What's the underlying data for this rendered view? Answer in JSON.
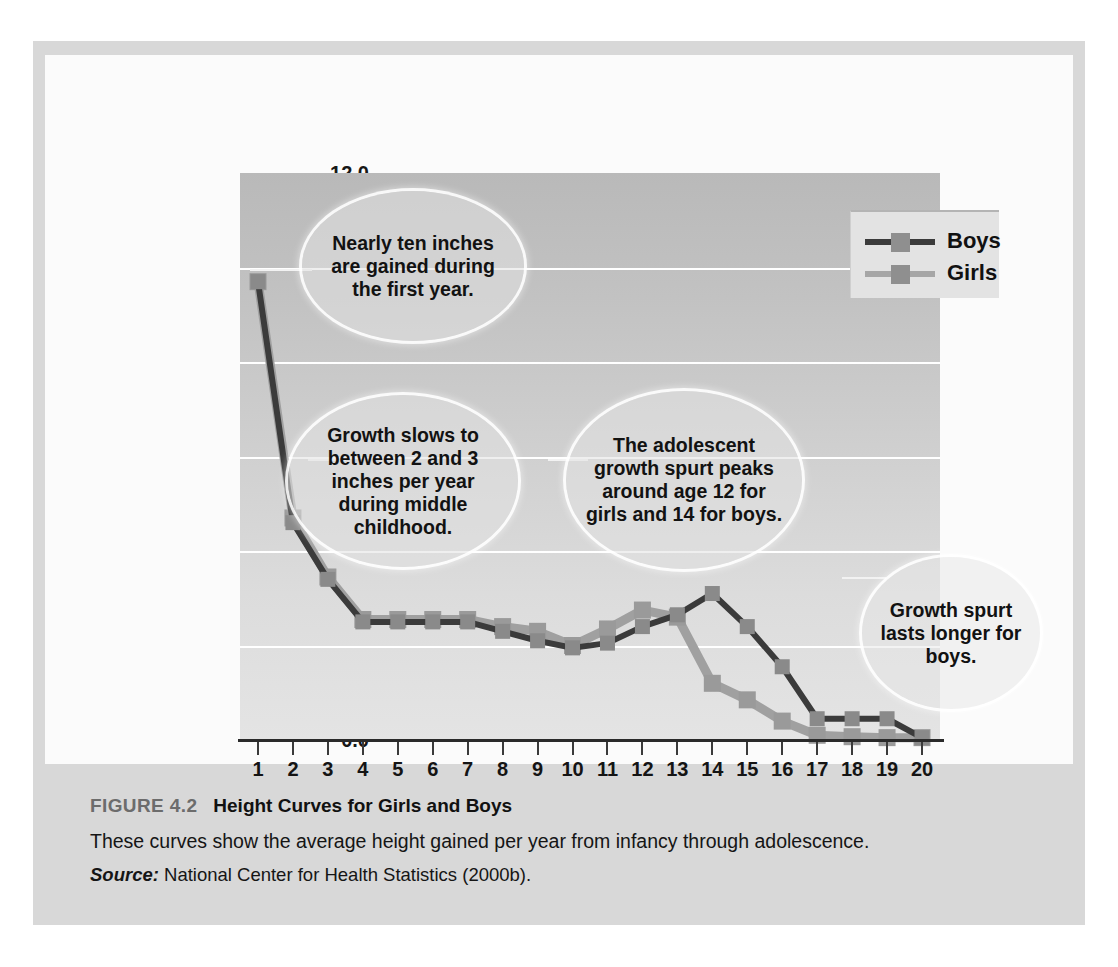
{
  "figure": {
    "number_label": "FIGURE 4.2",
    "title": "Height Curves for Girls and Boys",
    "description": "These curves show the average height gained per year from infancy through adolescence.",
    "source_label": "Source:",
    "source_text": "National Center for Health Statistics (2000b)."
  },
  "legend": {
    "position": "top-right-inside-plot",
    "items": [
      {
        "label": "Boys",
        "color": "#3b3b3b"
      },
      {
        "label": "Girls",
        "color": "#a0a0a0"
      }
    ]
  },
  "callouts": [
    {
      "id": "callout-first-year",
      "text": "Nearly ten inches are gained during the first year."
    },
    {
      "id": "callout-middle-childhood",
      "text": "Growth slows to between 2 and 3 inches per year during middle childhood."
    },
    {
      "id": "callout-adolescent-spurt",
      "text": "The adolescent growth spurt peaks around age 12 for girls and 14 for boys."
    },
    {
      "id": "callout-boys-longer",
      "text": "Growth spurt lasts longer for boys."
    }
  ],
  "chart_data": {
    "type": "line",
    "title": "Height Curves for Girls and Boys",
    "xlabel": "",
    "ylabel": "Average gain (inches) per year",
    "x": [
      1,
      2,
      3,
      4,
      5,
      6,
      7,
      8,
      9,
      10,
      11,
      12,
      13,
      14,
      15,
      16,
      17,
      18,
      19,
      20
    ],
    "xtick_labels": [
      "1",
      "2",
      "3",
      "4",
      "5",
      "6",
      "7",
      "8",
      "9",
      "10",
      "11",
      "12",
      "13",
      "14",
      "15",
      "16",
      "17",
      "18",
      "19",
      "20"
    ],
    "ytick_labels": [
      "0.0",
      "2.0",
      "4.0",
      "6.0",
      "8.0",
      "10.0",
      "12.0"
    ],
    "ytick_values": [
      0,
      2,
      4,
      6,
      8,
      10,
      12
    ],
    "xlim": [
      1,
      20
    ],
    "ylim": [
      0,
      12
    ],
    "grid": "horizontal-white",
    "legend_position": "upper right",
    "markers": "square",
    "series": [
      {
        "name": "Boys",
        "color": "#3b3b3b",
        "values": [
          9.7,
          4.6,
          3.4,
          2.5,
          2.5,
          2.5,
          2.5,
          2.3,
          2.1,
          1.95,
          2.05,
          2.4,
          2.65,
          3.1,
          2.4,
          1.55,
          0.45,
          0.45,
          0.45,
          0.05
        ]
      },
      {
        "name": "Girls",
        "color": "#a0a0a0",
        "values": [
          9.7,
          4.7,
          3.45,
          2.55,
          2.55,
          2.55,
          2.55,
          2.4,
          2.3,
          2.0,
          2.35,
          2.75,
          2.6,
          1.2,
          0.85,
          0.4,
          0.1,
          0.07,
          0.05,
          0.05
        ]
      }
    ]
  }
}
